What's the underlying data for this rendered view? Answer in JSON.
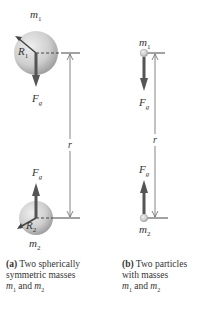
{
  "panel_a": {
    "mass1_label": "m",
    "mass1_sub": "1",
    "radius1_label": "R",
    "radius1_sub": "1",
    "force_label": "F",
    "force_sub": "g",
    "distance_label": "r",
    "mass2_label": "m",
    "mass2_sub": "2",
    "radius2_label": "R",
    "radius2_sub": "2",
    "caption_tag": "(a)",
    "caption_line1": " Two spherically",
    "caption_line2": "symmetric masses",
    "caption_line3_m1": "m",
    "caption_line3_sub1": "1",
    "caption_line3_and": " and ",
    "caption_line3_m2": "m",
    "caption_line3_sub2": "2"
  },
  "panel_b": {
    "mass1_label": "m",
    "mass1_sub": "1",
    "force_label": "F",
    "force_sub": "g",
    "distance_label": "r",
    "mass2_label": "m",
    "mass2_sub": "2",
    "caption_tag": "(b)",
    "caption_line1": " Two particles",
    "caption_line2": "with masses",
    "caption_line3_m1": "m",
    "caption_line3_sub1": "1",
    "caption_line3_and": " and ",
    "caption_line3_m2": "m",
    "caption_line3_sub2": "2"
  },
  "colors": {
    "sphere_light": "#e6e6e6",
    "sphere_dark": "#9a9a9a",
    "force_arrow": "#555555",
    "line": "#555555"
  }
}
